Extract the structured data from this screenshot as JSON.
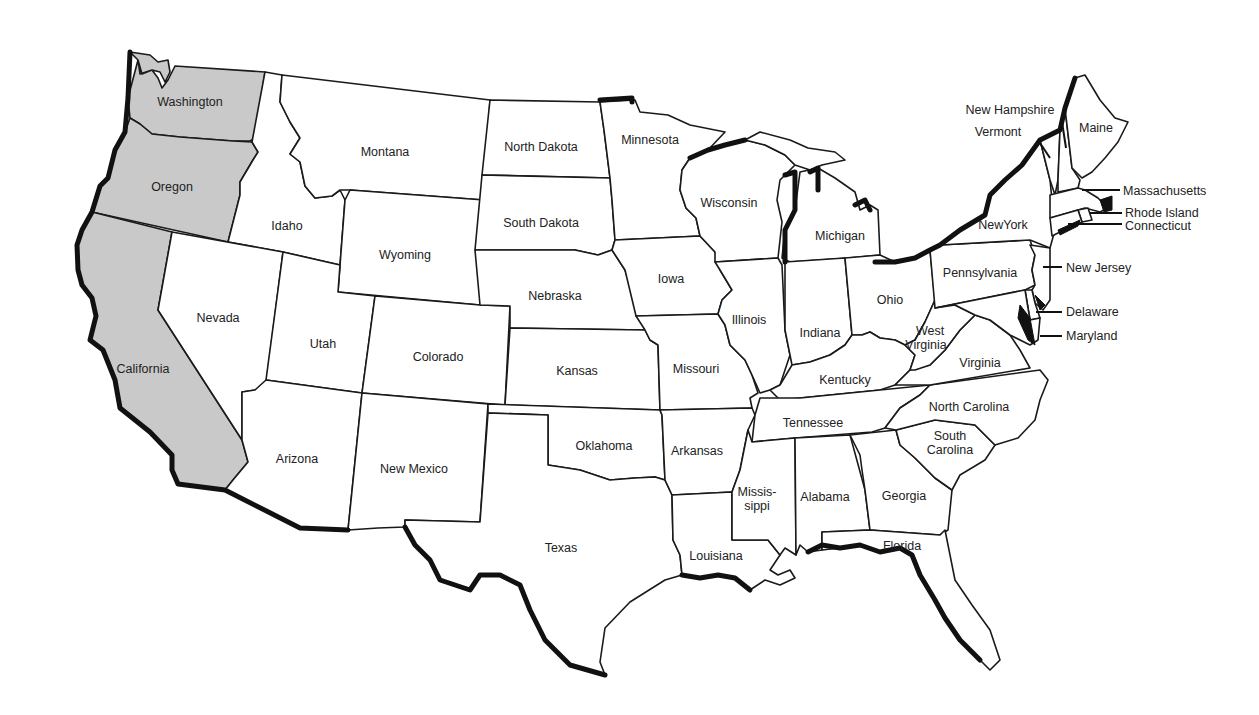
{
  "map": {
    "title": "United States",
    "highlight_color": "#c9c9c9",
    "base_color": "#ffffff",
    "border_color": "#1a1a1a",
    "highlighted_states": [
      "Washington",
      "Oregon",
      "California"
    ],
    "states": [
      {
        "id": "wa",
        "name": "Washington",
        "highlighted": true
      },
      {
        "id": "or",
        "name": "Oregon",
        "highlighted": true
      },
      {
        "id": "ca",
        "name": "California",
        "highlighted": true
      },
      {
        "id": "id",
        "name": "Idaho"
      },
      {
        "id": "nv",
        "name": "Nevada"
      },
      {
        "id": "mt",
        "name": "Montana"
      },
      {
        "id": "wy",
        "name": "Wyoming"
      },
      {
        "id": "ut",
        "name": "Utah"
      },
      {
        "id": "az",
        "name": "Arizona"
      },
      {
        "id": "co",
        "name": "Colorado"
      },
      {
        "id": "nm",
        "name": "New Mexico"
      },
      {
        "id": "nd",
        "name": "North Dakota"
      },
      {
        "id": "sd",
        "name": "South Dakota"
      },
      {
        "id": "ne",
        "name": "Nebraska"
      },
      {
        "id": "ks",
        "name": "Kansas"
      },
      {
        "id": "ok",
        "name": "Oklahoma"
      },
      {
        "id": "tx",
        "name": "Texas"
      },
      {
        "id": "mn",
        "name": "Minnesota"
      },
      {
        "id": "ia",
        "name": "Iowa"
      },
      {
        "id": "mo",
        "name": "Missouri"
      },
      {
        "id": "ar",
        "name": "Arkansas"
      },
      {
        "id": "la",
        "name": "Louisiana"
      },
      {
        "id": "wi",
        "name": "Wisconsin"
      },
      {
        "id": "il",
        "name": "Illinois"
      },
      {
        "id": "mi",
        "name": "Michigan"
      },
      {
        "id": "in",
        "name": "Indiana"
      },
      {
        "id": "oh",
        "name": "Ohio"
      },
      {
        "id": "ky",
        "name": "Kentucky"
      },
      {
        "id": "tn",
        "name": "Tennessee"
      },
      {
        "id": "ms",
        "name": "Missis-",
        "name2": "sippi"
      },
      {
        "id": "al",
        "name": "Alabama"
      },
      {
        "id": "ga",
        "name": "Georgia"
      },
      {
        "id": "fl",
        "name": "Florida"
      },
      {
        "id": "sc",
        "name": "South",
        "name2": "Carolina"
      },
      {
        "id": "nc",
        "name": "North Carolina"
      },
      {
        "id": "va",
        "name": "Virginia"
      },
      {
        "id": "wv",
        "name": "West",
        "name2": "Virginia"
      },
      {
        "id": "pa",
        "name": "Pennsylvania"
      },
      {
        "id": "ny",
        "name": "NewYork"
      },
      {
        "id": "vt",
        "name": "Vermont"
      },
      {
        "id": "nh",
        "name": "New Hampshire"
      },
      {
        "id": "me",
        "name": "Maine"
      },
      {
        "id": "ma",
        "name": "Massachusetts"
      },
      {
        "id": "ri",
        "name": "Rhode Island"
      },
      {
        "id": "ct",
        "name": "Connecticut"
      },
      {
        "id": "nj",
        "name": "New Jersey"
      },
      {
        "id": "de",
        "name": "Delaware"
      },
      {
        "id": "md",
        "name": "Maryland"
      }
    ]
  }
}
